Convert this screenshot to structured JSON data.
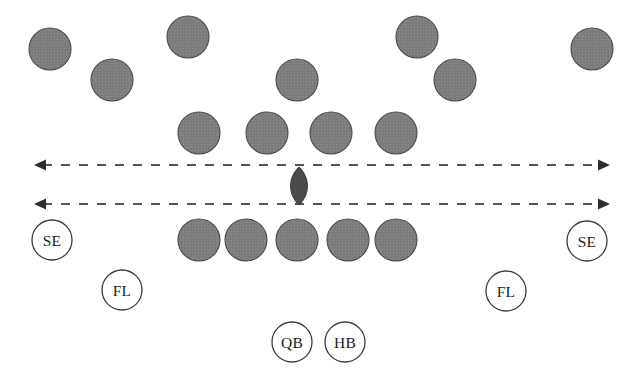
{
  "diagram": {
    "background_color": "#ffffff",
    "player_fill_color": "#7e7e7e",
    "player_stroke_color": "#4a4a4a",
    "ball_color": "#4a4a4a",
    "line_color": "#555555",
    "label_circle_stroke": "#3a3a3a",
    "label_text_color": "#1c1c1c"
  },
  "scrimmage_lines": [
    {
      "name": "upper-neutral-zone-line",
      "y": 165,
      "x_start": 34,
      "x_end": 610,
      "style": "dashed",
      "arrowheads": "both"
    },
    {
      "name": "lower-neutral-zone-line",
      "y": 204,
      "x_start": 34,
      "x_end": 610,
      "style": "dashed",
      "arrowheads": "both"
    }
  ],
  "ball": {
    "name": "football",
    "cx": 299,
    "cy": 186,
    "rx": 9,
    "ry": 19
  },
  "defense": [
    {
      "name": "defender-left-corner",
      "cx": 50,
      "cy": 49,
      "r": 21
    },
    {
      "name": "defender-left-safety",
      "cx": 112,
      "cy": 80,
      "r": 21
    },
    {
      "name": "defender-left-backer",
      "cx": 188,
      "cy": 37,
      "r": 21
    },
    {
      "name": "defender-middle-backer",
      "cx": 297,
      "cy": 80,
      "r": 21
    },
    {
      "name": "defender-right-backer",
      "cx": 417,
      "cy": 37,
      "r": 21
    },
    {
      "name": "defender-right-safety",
      "cx": 455,
      "cy": 80,
      "r": 21
    },
    {
      "name": "defender-right-corner",
      "cx": 592,
      "cy": 49,
      "r": 21
    },
    {
      "name": "defensive-lineman-1",
      "cx": 199,
      "cy": 133,
      "r": 21
    },
    {
      "name": "defensive-lineman-2",
      "cx": 267,
      "cy": 133,
      "r": 21
    },
    {
      "name": "defensive-lineman-3",
      "cx": 331,
      "cy": 133,
      "r": 21
    },
    {
      "name": "defensive-lineman-4",
      "cx": 396,
      "cy": 133,
      "r": 21
    }
  ],
  "offensive_line": [
    {
      "name": "offensive-lineman-left-tackle",
      "cx": 199,
      "cy": 240,
      "r": 21
    },
    {
      "name": "offensive-lineman-left-guard",
      "cx": 246,
      "cy": 240,
      "r": 21
    },
    {
      "name": "offensive-lineman-center",
      "cx": 297,
      "cy": 240,
      "r": 21
    },
    {
      "name": "offensive-lineman-right-guard",
      "cx": 348,
      "cy": 240,
      "r": 21
    },
    {
      "name": "offensive-lineman-right-tackle",
      "cx": 396,
      "cy": 240,
      "r": 21
    }
  ],
  "labeled_players": [
    {
      "name": "split-end-left",
      "label": "SE",
      "cx": 52,
      "cy": 240,
      "r": 20
    },
    {
      "name": "split-end-right",
      "label": "SE",
      "cx": 587,
      "cy": 241,
      "r": 20
    },
    {
      "name": "flanker-left",
      "label": "FL",
      "cx": 122,
      "cy": 290,
      "r": 20
    },
    {
      "name": "flanker-right",
      "label": "FL",
      "cx": 506,
      "cy": 291,
      "r": 20
    },
    {
      "name": "quarterback",
      "label": "QB",
      "cx": 292,
      "cy": 342,
      "r": 20
    },
    {
      "name": "halfback",
      "label": "HB",
      "cx": 345,
      "cy": 342,
      "r": 20
    }
  ]
}
